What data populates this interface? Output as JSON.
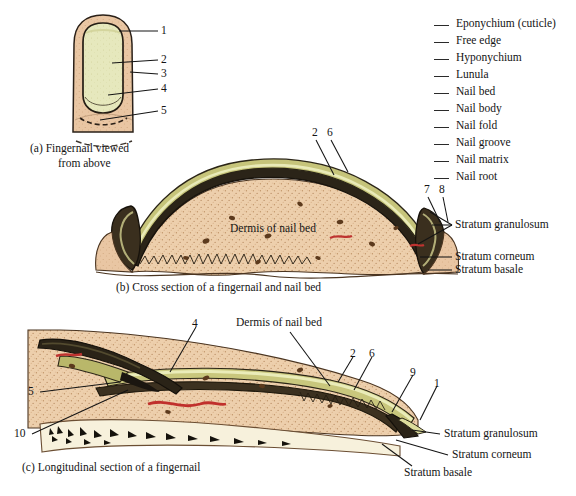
{
  "figure": {
    "panels": [
      {
        "id": "a",
        "caption_line1": "(a) Fingernail viewed",
        "caption_line2": "from above",
        "numbers": [
          "1",
          "2",
          "3",
          "4",
          "5"
        ]
      },
      {
        "id": "b",
        "caption": "(b) Cross section of a fingernail and nail bed",
        "numbers": [
          "2",
          "6",
          "7",
          "8"
        ],
        "inner_label": "Dermis of nail bed",
        "side_labels": [
          "Stratum granulosum",
          "Stratum corneum",
          "Stratum basale"
        ]
      },
      {
        "id": "c",
        "caption": "(c) Longitudinal section of a fingernail",
        "numbers": [
          "4",
          "5",
          "10",
          "2",
          "6",
          "9",
          "1"
        ],
        "inner_label": "Dermis of nail bed",
        "side_labels": [
          "Stratum granulosum",
          "Stratum corneum",
          "Stratum basale"
        ]
      }
    ]
  },
  "legend": {
    "items": [
      {
        "label": "Eponychium (cuticle)"
      },
      {
        "label": "Free edge"
      },
      {
        "label": "Hyponychium"
      },
      {
        "label": "Lunula"
      },
      {
        "label": "Nail bed"
      },
      {
        "label": "Nail body"
      },
      {
        "label": "Nail fold"
      },
      {
        "label": "Nail groove"
      },
      {
        "label": "Nail matrix"
      },
      {
        "label": "Nail root"
      }
    ]
  },
  "colors": {
    "skin": "#e7c3a0",
    "skin_light": "#f0d5b8",
    "nail_plate": "#e4e7bb",
    "nail_olive": "#b9b76a",
    "dermis": "#edcfac",
    "bone": "#f6f0da",
    "outline": "#1f1a14",
    "vessel": "#c0302c",
    "speck": "#6b4226",
    "text": "#141414"
  }
}
